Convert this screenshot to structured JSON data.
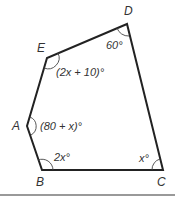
{
  "figure": {
    "type": "pentagon",
    "stroke_color": "#222222",
    "vertices": [
      {
        "label": "D",
        "x": 127,
        "y": 24,
        "lx": 127,
        "ly": 16
      },
      {
        "label": "E",
        "x": 47,
        "y": 58,
        "lx": 37,
        "ly": 52
      },
      {
        "label": "A",
        "x": 27,
        "y": 126,
        "lx": 13,
        "ly": 130
      },
      {
        "label": "B",
        "x": 42,
        "y": 170,
        "lx": 36,
        "ly": 185
      },
      {
        "label": "C",
        "x": 163,
        "y": 170,
        "lx": 157,
        "ly": 185
      }
    ],
    "angles": [
      {
        "vertex": "D",
        "text": "60°",
        "x": 107,
        "y": 49
      },
      {
        "vertex": "E",
        "text": "(2x + 10)°",
        "x": 57,
        "y": 76
      },
      {
        "vertex": "A",
        "text": "(80 + x)°",
        "x": 40,
        "y": 130
      },
      {
        "vertex": "B",
        "text": "2x°",
        "x": 55,
        "y": 163
      },
      {
        "vertex": "C",
        "text": "x°",
        "x": 140,
        "y": 163
      }
    ]
  },
  "labels": {
    "D": "D",
    "E": "E",
    "A": "A",
    "B": "B",
    "C": "C",
    "angle_D": "60°",
    "angle_E": "(2x + 10)°",
    "angle_A": "(80 + x)°",
    "angle_B": "2x°",
    "angle_C": "x°"
  },
  "divider_color": "#999999"
}
